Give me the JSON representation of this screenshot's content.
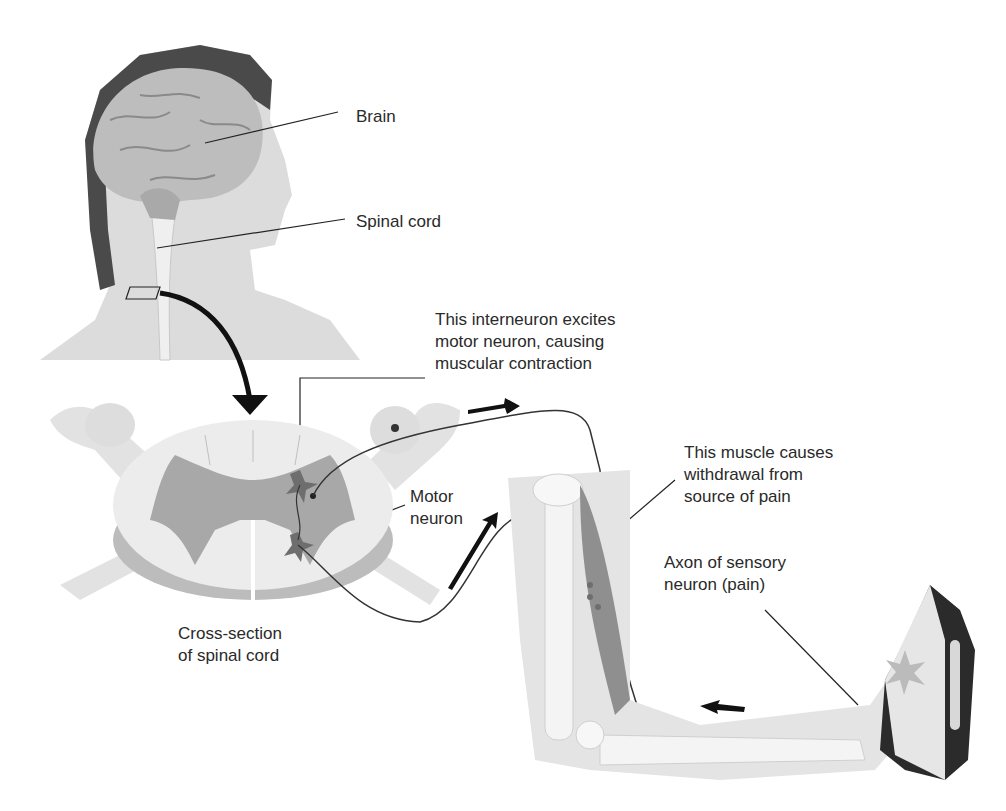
{
  "diagram": {
    "labels": {
      "brain": "Brain",
      "spinal_cord": "Spinal cord",
      "interneuron": [
        "This interneuron excites",
        "motor neuron, causing",
        "muscular contraction"
      ],
      "motor_neuron": [
        "Motor",
        "neuron"
      ],
      "muscle": [
        "This muscle causes",
        "withdrawal from",
        "source of pain"
      ],
      "sensory_axon": [
        "Axon of sensory",
        "neuron (pain)"
      ],
      "cross_section": [
        "Cross-section",
        "of spinal cord"
      ]
    },
    "colors": {
      "gray_matter": "#a8a8a8",
      "white_matter": "#e6e6e6",
      "muscle": "#8f8f8f",
      "iron": "#2b2b2b",
      "neuron": "#5a5a5a",
      "line": "#222222"
    }
  }
}
